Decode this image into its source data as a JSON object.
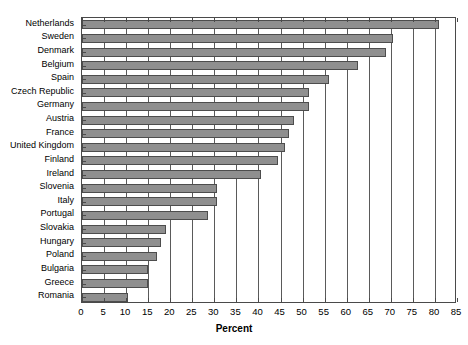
{
  "chart_data": {
    "type": "bar",
    "orientation": "horizontal",
    "title": "",
    "subtitle": "",
    "xlabel": "Percent",
    "ylabel": "",
    "xlim": [
      0,
      85
    ],
    "xticks": [
      0,
      5,
      10,
      15,
      20,
      25,
      30,
      35,
      40,
      45,
      50,
      55,
      60,
      65,
      70,
      75,
      80,
      85
    ],
    "grid": "vertical",
    "legend": "none",
    "bar_color": "#8f8f8f",
    "bar_edge_color": "#4d4d4d",
    "axis_color": "#4a4a4a",
    "categories": [
      "Netherlands",
      "Sweden",
      "Denmark",
      "Belgium",
      "Spain",
      "Czech Republic",
      "Germany",
      "Austria",
      "France",
      "United Kingdom",
      "Finland",
      "Ireland",
      "Slovenia",
      "Italy",
      "Portugal",
      "Slovakia",
      "Hungary",
      "Poland",
      "Bulgaria",
      "Greece",
      "Romania"
    ],
    "values": [
      81,
      70.5,
      69,
      62.5,
      56,
      51.5,
      51.5,
      48,
      47,
      46,
      44.5,
      40.5,
      30.5,
      30.5,
      28.5,
      19,
      18,
      17,
      15,
      15,
      10.5
    ]
  }
}
